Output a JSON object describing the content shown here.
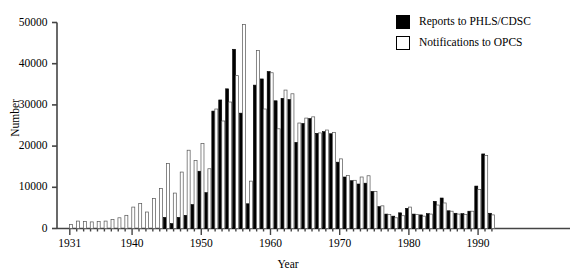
{
  "chart_data": {
    "type": "bar",
    "title": "",
    "xlabel": "Year",
    "ylabel": "Number",
    "ylim": [
      0,
      50000
    ],
    "xlim": [
      1930.4,
      1992.6
    ],
    "grid": false,
    "legend_position": "top-right",
    "yticks": [
      0,
      10000,
      20000,
      30000,
      40000,
      50000
    ],
    "ytick_labels": [
      "0",
      "10000",
      "20000",
      "30000",
      "40000",
      "50000"
    ],
    "xticks": [
      1931,
      1940,
      1950,
      1960,
      1970,
      1980,
      1990
    ],
    "xtick_labels": [
      "1931",
      "1940",
      "1950",
      "1960",
      "1970",
      "1980",
      "1990"
    ],
    "categories": [
      1931,
      1932,
      1933,
      1934,
      1935,
      1936,
      1937,
      1938,
      1939,
      1940,
      1941,
      1942,
      1943,
      1944,
      1945,
      1946,
      1947,
      1948,
      1949,
      1950,
      1951,
      1952,
      1953,
      1954,
      1955,
      1956,
      1957,
      1958,
      1959,
      1960,
      1961,
      1962,
      1963,
      1964,
      1965,
      1966,
      1967,
      1968,
      1969,
      1970,
      1971,
      1972,
      1973,
      1974,
      1975,
      1976,
      1977,
      1978,
      1979,
      1980,
      1981,
      1982,
      1983,
      1984,
      1985,
      1986,
      1987,
      1988,
      1989,
      1990,
      1991,
      1992
    ],
    "series": [
      {
        "name": "Reports to PHLS/CDSC",
        "color": "#000000",
        "values": [
          0,
          0,
          0,
          0,
          0,
          0,
          0,
          0,
          0,
          0,
          0,
          0,
          0,
          0,
          2700,
          1200,
          2700,
          3200,
          5800,
          13900,
          8700,
          28500,
          31200,
          33900,
          43500,
          28000,
          6000,
          34800,
          36300,
          38100,
          31000,
          31600,
          31300,
          20900,
          25500,
          26700,
          23100,
          23500,
          23000,
          16100,
          12500,
          11600,
          10800,
          11000,
          9000,
          5300,
          3500,
          3000,
          3800,
          4900,
          3500,
          3300,
          3600,
          6600,
          7400,
          4300,
          3700,
          3600,
          4200,
          10300,
          18100,
          3700
        ]
      },
      {
        "name": "Notifications to OPCS",
        "color": "#ffffff",
        "values": [
          1000,
          1800,
          1700,
          1600,
          1700,
          1800,
          2200,
          2600,
          3200,
          5200,
          6100,
          4000,
          7300,
          9700,
          15800,
          8600,
          13700,
          19000,
          16500,
          20600,
          14500,
          29000,
          26100,
          30700,
          37100,
          49500,
          11500,
          43200,
          29000,
          37800,
          24200,
          33600,
          32700,
          25600,
          26800,
          27100,
          23200,
          23900,
          23300,
          16900,
          12900,
          11700,
          12500,
          12800,
          9000,
          5500,
          3400,
          2600,
          3100,
          5200,
          3400,
          3000,
          3500,
          5700,
          6200,
          4200,
          3500,
          3400,
          4200,
          9500,
          17700,
          3300
        ]
      }
    ]
  },
  "legend": {
    "items": [
      {
        "label": "Reports to PHLS/CDSC",
        "style": "filled"
      },
      {
        "label": "Notifications to OPCS",
        "style": "hollow"
      }
    ]
  },
  "axes": {
    "x_axis_title": "Year",
    "y_axis_title": "Number"
  }
}
